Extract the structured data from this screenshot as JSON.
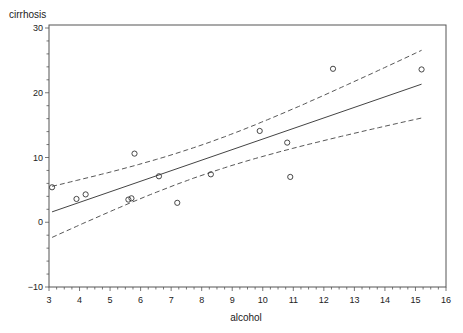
{
  "chart_data": {
    "type": "scatter",
    "title": "",
    "xlabel": "alcohol",
    "ylabel": "cirrhosis",
    "xlim": [
      3,
      16
    ],
    "ylim": [
      -10,
      30
    ],
    "xticks": [
      3,
      4,
      5,
      6,
      7,
      8,
      9,
      10,
      11,
      12,
      13,
      14,
      15,
      16
    ],
    "yticks": [
      -10,
      0,
      10,
      20,
      30
    ],
    "grid": false,
    "legend": null,
    "series": [
      {
        "name": "observed",
        "type": "scatter",
        "marker": "open-circle",
        "points": [
          {
            "x": 3.1,
            "y": 5.4
          },
          {
            "x": 3.9,
            "y": 3.6
          },
          {
            "x": 4.2,
            "y": 4.3
          },
          {
            "x": 5.6,
            "y": 3.5
          },
          {
            "x": 5.7,
            "y": 3.7
          },
          {
            "x": 5.8,
            "y": 10.6
          },
          {
            "x": 6.6,
            "y": 7.1
          },
          {
            "x": 7.2,
            "y": 3.0
          },
          {
            "x": 8.3,
            "y": 7.4
          },
          {
            "x": 9.9,
            "y": 14.1
          },
          {
            "x": 10.8,
            "y": 12.3
          },
          {
            "x": 10.9,
            "y": 7.0
          },
          {
            "x": 12.3,
            "y": 23.7
          },
          {
            "x": 15.2,
            "y": 23.6
          }
        ]
      },
      {
        "name": "regression fit",
        "type": "line",
        "style": "solid",
        "points": [
          {
            "x": 3.1,
            "y": 1.6
          },
          {
            "x": 15.2,
            "y": 21.3
          }
        ]
      },
      {
        "name": "upper confidence limit",
        "type": "line",
        "style": "dashed",
        "points": [
          {
            "x": 3.1,
            "y": 5.6
          },
          {
            "x": 8.9,
            "y": 12.1
          },
          {
            "x": 15.2,
            "y": 26.9
          }
        ]
      },
      {
        "name": "lower confidence limit",
        "type": "line",
        "style": "dashed",
        "points": [
          {
            "x": 3.1,
            "y": -2.4
          },
          {
            "x": 8.9,
            "y": 7.1
          },
          {
            "x": 15.2,
            "y": 15.7
          }
        ]
      }
    ],
    "fit": {
      "slope": 1.63,
      "intercept": -3.45,
      "x_range": [
        3.1,
        15.2
      ],
      "band_center": 8.0,
      "band_a": 5.5,
      "band_b": 0.42
    }
  },
  "colors": {
    "axis": "#555555",
    "points": "#333333",
    "line": "#444444"
  }
}
